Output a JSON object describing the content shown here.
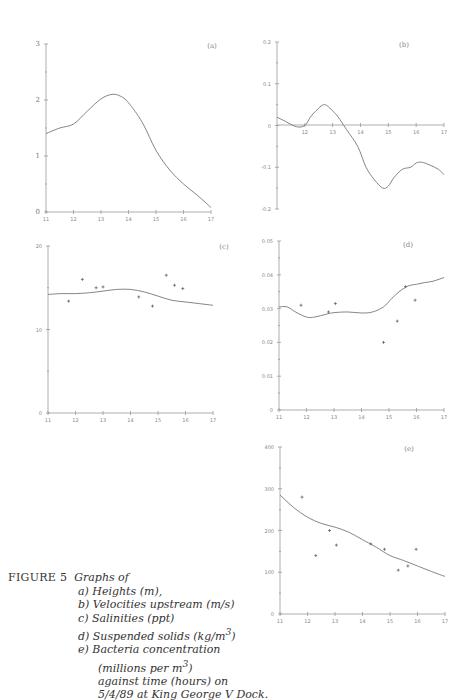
{
  "figure": {
    "caption": {
      "label": "FIGURE 5",
      "intro": "Graphs of",
      "items": [
        "a) Heights (m),",
        "b) Velocities upstream (m/s)",
        "c) Salinities (ppt)",
        "d) Suspended solids (kg/m",
        "e) Bacteria concentration"
      ],
      "d_sup": "3",
      "d_tail": ")",
      "e_cont1": "(millions per m",
      "e_cont1_sup": "3",
      "e_cont1_tail": ")",
      "e_cont2": "against time (hours) on",
      "e_cont3": "5/4/89 at King George V Dock."
    }
  },
  "chart_data": [
    {
      "id": "a",
      "panel_label": "(a)",
      "type": "line",
      "title": "Heights (m)",
      "xlabel": "time (hours)",
      "ylabel": "Height (m)",
      "xlim": [
        11,
        17
      ],
      "ylim": [
        0,
        3
      ],
      "xticks": [
        "11",
        "12",
        "13",
        "14",
        "15",
        "16",
        "17"
      ],
      "yticks": [
        "0",
        "1",
        "2",
        "3"
      ],
      "series": [
        {
          "name": "model",
          "x": [
            11,
            11.5,
            12,
            12.5,
            13,
            13.4,
            13.7,
            14,
            14.5,
            15,
            15.5,
            16,
            16.5,
            17
          ],
          "y": [
            1.4,
            1.5,
            1.57,
            1.8,
            2.02,
            2.1,
            2.07,
            1.95,
            1.6,
            1.1,
            0.75,
            0.5,
            0.3,
            0.08
          ]
        }
      ]
    },
    {
      "id": "b",
      "panel_label": "(b)",
      "type": "line",
      "title": "Velocities upstream (m/s)",
      "xlabel": "time (hours)",
      "ylabel": "Velocity (m/s)",
      "xlim": [
        11,
        17
      ],
      "ylim": [
        -0.2,
        0.2
      ],
      "xticks": [
        "12",
        "13",
        "14",
        "15",
        "16",
        "17"
      ],
      "yticks": [
        "0.2",
        "0.1",
        "0",
        "-0.1",
        "-0.2"
      ],
      "series": [
        {
          "name": "model",
          "x": [
            11,
            11.3,
            11.7,
            12,
            12.2,
            12.4,
            12.7,
            13,
            13.2,
            13.5,
            13.9,
            14.2,
            14.5,
            14.8,
            15,
            15.2,
            15.5,
            15.8,
            16,
            16.2,
            16.5,
            16.8,
            17
          ],
          "y": [
            0.02,
            0.01,
            -0.003,
            0.0,
            0.02,
            0.035,
            0.05,
            0.035,
            0.02,
            -0.01,
            -0.05,
            -0.1,
            -0.13,
            -0.15,
            -0.145,
            -0.125,
            -0.105,
            -0.1,
            -0.09,
            -0.088,
            -0.095,
            -0.105,
            -0.118
          ]
        }
      ]
    },
    {
      "id": "c",
      "panel_label": "(c)",
      "type": "line+scatter",
      "title": "Salinities (ppt)",
      "xlabel": "time (hours)",
      "ylabel": "Salinity (ppt)",
      "xlim": [
        11,
        17
      ],
      "ylim": [
        0,
        20
      ],
      "xticks": [
        "11",
        "12",
        "13",
        "14",
        "15",
        "16",
        "17"
      ],
      "yticks": [
        "0",
        "10",
        "20"
      ],
      "series": [
        {
          "name": "model",
          "x": [
            11,
            11.5,
            12,
            12.5,
            13,
            13.5,
            14,
            14.5,
            15,
            15.5,
            16,
            16.5,
            17
          ],
          "y": [
            14.2,
            14.3,
            14.3,
            14.4,
            14.6,
            14.8,
            14.8,
            14.5,
            14.0,
            13.5,
            13.3,
            13.1,
            12.9
          ]
        },
        {
          "name": "observed",
          "marker": "+",
          "x": [
            11.75,
            12.25,
            12.75,
            13.0,
            14.3,
            14.8,
            15.3,
            15.6,
            15.9
          ],
          "y": [
            13.4,
            16.0,
            15.0,
            15.1,
            13.9,
            12.8,
            16.5,
            15.3,
            14.9
          ]
        }
      ]
    },
    {
      "id": "d",
      "panel_label": "(d)",
      "type": "line+scatter",
      "title": "Suspended solids (kg/m3)",
      "xlabel": "time (hours)",
      "ylabel": "Suspended solids (kg/m3)",
      "xlim": [
        11,
        17
      ],
      "ylim": [
        0,
        0.05
      ],
      "xticks": [
        "11",
        "12",
        "13",
        "14",
        "15",
        "16",
        "17"
      ],
      "yticks": [
        "0",
        "0.01",
        "0.02",
        "0.03",
        "0.04",
        "0.05"
      ],
      "series": [
        {
          "name": "model",
          "x": [
            11,
            11.3,
            11.6,
            12,
            12.3,
            12.7,
            13,
            13.5,
            14,
            14.4,
            14.8,
            15.1,
            15.4,
            15.7,
            16,
            16.3,
            16.6,
            17
          ],
          "y": [
            0.0305,
            0.0305,
            0.029,
            0.0275,
            0.0275,
            0.0283,
            0.0288,
            0.029,
            0.0287,
            0.029,
            0.0305,
            0.033,
            0.0352,
            0.0367,
            0.0372,
            0.0377,
            0.0381,
            0.0392
          ]
        },
        {
          "name": "observed",
          "marker": "+",
          "x": [
            11.8,
            12.8,
            13.05,
            14.8,
            15.3,
            15.6,
            15.95
          ],
          "y": [
            0.031,
            0.029,
            0.0315,
            0.02,
            0.0263,
            0.0365,
            0.0325
          ]
        }
      ]
    },
    {
      "id": "e",
      "panel_label": "(e)",
      "type": "line+scatter",
      "title": "Bacteria concentration (millions per m3)",
      "xlabel": "time (hours)",
      "ylabel": "Bacteria (millions per m3)",
      "xlim": [
        11,
        17
      ],
      "ylim": [
        0,
        400
      ],
      "xticks": [
        "11",
        "12",
        "13",
        "14",
        "15",
        "16",
        "17"
      ],
      "yticks": [
        "0",
        "100",
        "200",
        "300",
        "400"
      ],
      "series": [
        {
          "name": "model",
          "x": [
            11,
            11.5,
            12,
            12.5,
            13,
            13.5,
            14,
            14.5,
            15,
            15.5,
            16,
            16.5,
            17
          ],
          "y": [
            285,
            255,
            232,
            217,
            208,
            196,
            178,
            160,
            140,
            128,
            115,
            102,
            90
          ]
        },
        {
          "name": "observed",
          "marker": "+",
          "x": [
            11.8,
            12.3,
            12.8,
            13.05,
            14.3,
            14.8,
            15.3,
            15.65,
            15.95
          ],
          "y": [
            280,
            140,
            200,
            165,
            168,
            155,
            105,
            115,
            155
          ]
        }
      ]
    }
  ]
}
